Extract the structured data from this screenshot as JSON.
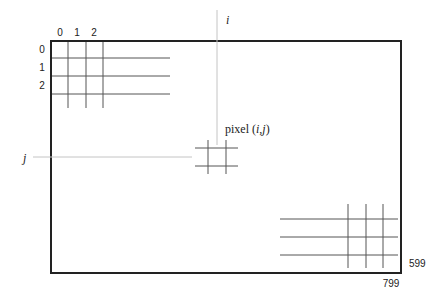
{
  "diagram": {
    "column_labels": [
      "0",
      "1",
      "2"
    ],
    "row_labels": [
      "0",
      "1",
      "2"
    ],
    "column_axis_label": "i",
    "row_axis_label": "j",
    "pixel_label_prefix": "pixel (",
    "pixel_label_i": "i",
    "pixel_label_sep": ",",
    "pixel_label_j": "j",
    "pixel_label_suffix": ")",
    "max_row_label": "599",
    "max_column_label": "799",
    "width_pixels": 800,
    "height_pixels": 600,
    "colors": {
      "border": "#222222",
      "grid_lines": "#555555",
      "axis_guides": "#c4c4c4",
      "text": "#222222"
    }
  }
}
